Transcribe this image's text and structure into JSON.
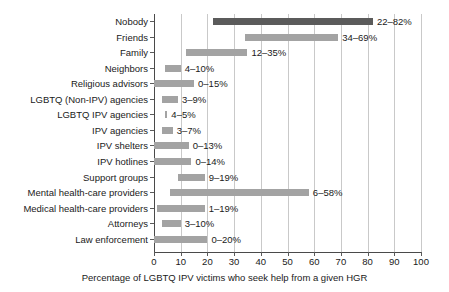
{
  "chart_data": {
    "type": "bar",
    "subtype": "horizontal-range-bar",
    "title": "",
    "subtitle": "",
    "xlabel": "Percentage of LGBTQ IPV victims who seek help from a given HGR",
    "ylabel": "",
    "xlim": [
      0,
      100
    ],
    "xticks": [
      0,
      10,
      20,
      30,
      40,
      50,
      60,
      70,
      80,
      90,
      100
    ],
    "xtick_labels": [
      "0",
      "10",
      "20",
      "30",
      "40",
      "50",
      "60",
      "70",
      "80",
      "90",
      "100"
    ],
    "grid": true,
    "grid_axis": "x",
    "legend": false,
    "legend_position": "none",
    "value_label_suffix": "%",
    "value_label_separator": "–",
    "colors": {
      "bar_default": "#a3a3a3",
      "bar_accent": "#5b5b5b",
      "grid": "#c9c9c9",
      "axis": "#4a4a4a",
      "text": "#1a1a1a",
      "background": "#ffffff"
    },
    "categories": [
      "Nobody",
      "Friends",
      "Family",
      "Neighbors",
      "Religious advisors",
      "LGBTQ (Non-IPV) agencies",
      "LGBTQ IPV agencies",
      "IPV agencies",
      "IPV shelters",
      "IPV hotlines",
      "Support groups",
      "Mental health-care providers",
      "Medical health-care providers",
      "Attorneys",
      "Law enforcement"
    ],
    "low": [
      22,
      34,
      12,
      4,
      0,
      3,
      4,
      3,
      0,
      0,
      9,
      6,
      1,
      3,
      0
    ],
    "high": [
      82,
      69,
      35,
      10,
      15,
      9,
      5,
      7,
      13,
      14,
      19,
      58,
      19,
      10,
      20
    ],
    "value_labels": [
      "22–82%",
      "34–69%",
      "12–35%",
      "4–10%",
      "0–15%",
      "3–9%",
      "4–5%",
      "3–7%",
      "0–13%",
      "0–14%",
      "9–19%",
      "6–58%",
      "1–19%",
      "3–10%",
      "0–20%"
    ],
    "highlighted_categories": [
      "Nobody"
    ]
  }
}
